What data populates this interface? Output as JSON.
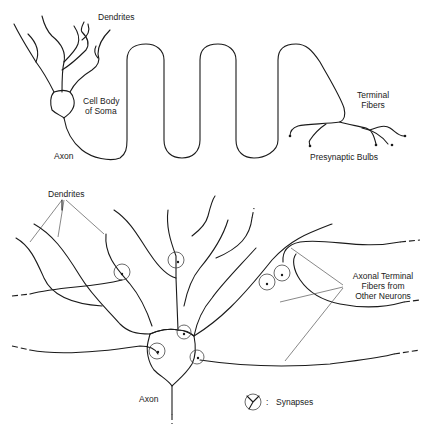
{
  "top_neuron": {
    "labels": {
      "dendrites": "Dendrites",
      "cell_body_line1": "Cell Body",
      "cell_body_line2": "of Soma",
      "axon": "Axon",
      "terminal_fibers_line1": "Terminal",
      "terminal_fibers_line2": "Fibers",
      "presynaptic_bulbs": "Presynaptic Bulbs"
    }
  },
  "bottom_neuron": {
    "labels": {
      "dendrites": "Dendrites",
      "axon": "Axon",
      "axonal_terminal_line1": "Axonal Terminal",
      "axonal_terminal_line2": "Fibers  from",
      "axonal_terminal_line3": "Other Neurons"
    }
  },
  "legend": {
    "symbol": "synapse-symbol",
    "separator": ":",
    "label": "Synapses"
  }
}
